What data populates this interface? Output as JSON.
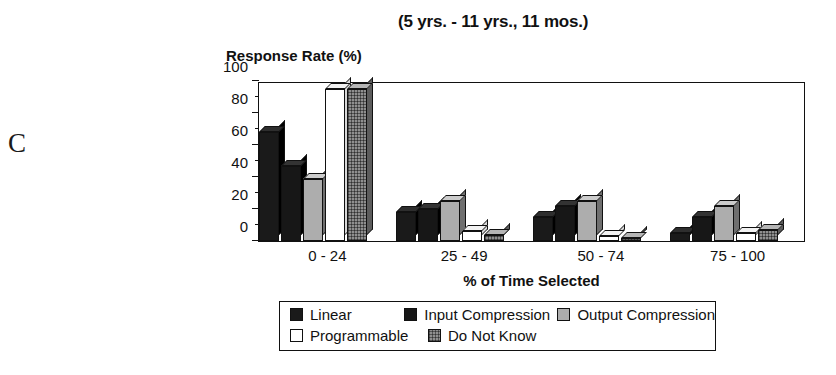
{
  "panel_letter": "C",
  "chart_data": {
    "type": "bar",
    "title": "(5 yrs. - 11 yrs., 11 mos.)",
    "xlabel": "% of Time Selected",
    "ylabel": "Response Rate (%)",
    "ylim": [
      0,
      100
    ],
    "yticks": [
      0,
      20,
      40,
      60,
      80,
      100
    ],
    "yticks_minor": [
      10,
      30,
      50,
      70,
      90
    ],
    "grid": false,
    "legend_position": "bottom",
    "categories": [
      "0 - 24",
      "25 - 49",
      "50 - 74",
      "75 - 100"
    ],
    "series": [
      {
        "name": "Linear",
        "fill": "solid-black",
        "color": "#1a1a1a",
        "values": [
          68,
          18,
          15,
          5
        ]
      },
      {
        "name": "Input Compression",
        "fill": "solid-black",
        "color": "#171717",
        "values": [
          47,
          20,
          22,
          15
        ]
      },
      {
        "name": "Output Compression",
        "fill": "light-gray",
        "color": "#adadad",
        "values": [
          39,
          25,
          25,
          22
        ]
      },
      {
        "name": "Programmable",
        "fill": "white",
        "color": "#ffffff",
        "values": [
          95,
          6,
          3,
          5
        ]
      },
      {
        "name": "Do Not Know",
        "fill": "gray-hatched",
        "color": "#8f8f8f",
        "values": [
          95,
          4,
          2,
          7
        ]
      }
    ]
  }
}
